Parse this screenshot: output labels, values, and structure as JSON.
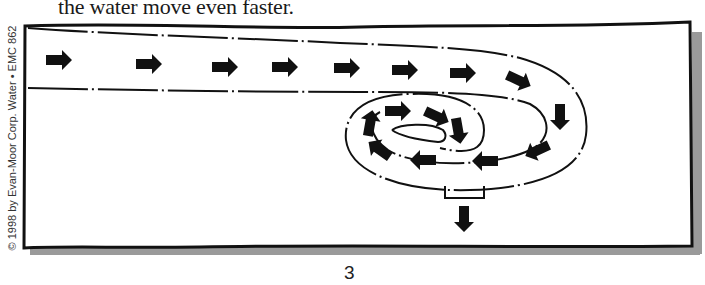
{
  "page": {
    "caption": "the water move even faster.",
    "copyright": "© 1998 by Evan-Moor Corp.    Water  •  EMC 862",
    "page_number": "3"
  },
  "diagram": {
    "colors": {
      "ink": "#111111",
      "shadow": "#9a9a9a",
      "paper": "#ffffff"
    },
    "straight_arrows": [
      {
        "x": 58,
        "y": 60,
        "dir": "right"
      },
      {
        "x": 148,
        "y": 64,
        "dir": "right"
      },
      {
        "x": 224,
        "y": 67,
        "dir": "right"
      },
      {
        "x": 284,
        "y": 67,
        "dir": "right"
      },
      {
        "x": 346,
        "y": 68,
        "dir": "right"
      },
      {
        "x": 404,
        "y": 70,
        "dir": "right"
      },
      {
        "x": 462,
        "y": 73,
        "dir": "right"
      }
    ],
    "outer_loop_arrows": [
      {
        "x": 518,
        "y": 80,
        "rot": 25
      },
      {
        "x": 560,
        "y": 116,
        "rot": 90
      },
      {
        "x": 538,
        "y": 150,
        "rot": 155
      },
      {
        "x": 486,
        "y": 161,
        "rot": 180
      },
      {
        "x": 424,
        "y": 160,
        "rot": 180
      },
      {
        "x": 380,
        "y": 150,
        "rot": 215
      },
      {
        "x": 370,
        "y": 124,
        "rot": 280
      }
    ],
    "inner_loop_arrows": [
      {
        "x": 397,
        "y": 111,
        "rot": 0
      },
      {
        "x": 436,
        "y": 116,
        "rot": 25
      },
      {
        "x": 458,
        "y": 130,
        "rot": 80
      }
    ],
    "drain_arrow": {
      "x": 464,
      "y": 218,
      "rot": 90
    }
  }
}
